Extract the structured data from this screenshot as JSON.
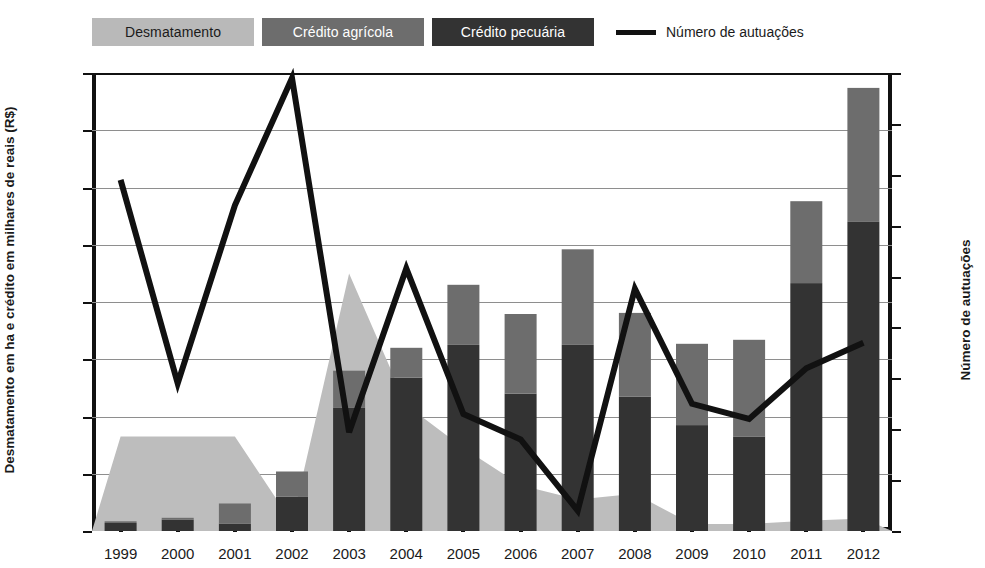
{
  "legend": {
    "items": [
      {
        "label": "Desmatamento",
        "type": "area",
        "color": "#bdbdbd"
      },
      {
        "label": "Crédito agrícola",
        "type": "bar",
        "color": "#6d6d6d"
      },
      {
        "label": "Crédito pecuária",
        "type": "bar",
        "color": "#333333"
      },
      {
        "label": "Número de autuações",
        "type": "line",
        "color": "#111111"
      }
    ]
  },
  "axes": {
    "left": {
      "title": "Desmatamento em ha e crédito em milhares de reais (R$)",
      "ticks": [
        "0",
        "10.000",
        "20.000",
        "30.000",
        "40.000",
        "50.000",
        "60.000",
        "70.000",
        "80.000"
      ],
      "min": 0,
      "max": 80000,
      "step": 10000
    },
    "right": {
      "title": "Número de autuações",
      "ticks": [
        "0",
        "5",
        "10",
        "15",
        "20",
        "25",
        "30",
        "35",
        "40",
        "45"
      ],
      "min": 0,
      "max": 45,
      "step": 5
    },
    "x": {
      "categories": [
        "1999",
        "2000",
        "2001",
        "2002",
        "2003",
        "2004",
        "2005",
        "2006",
        "2007",
        "2008",
        "2009",
        "2010",
        "2011",
        "2012"
      ]
    }
  },
  "chart_data": {
    "type": "bar",
    "title": "",
    "xlabel": "",
    "ylabel": "Desmatamento em ha e crédito em milhares de reais (R$)",
    "ylabel_secondary": "Número de autuações",
    "ylim": [
      0,
      80000
    ],
    "ylim_secondary": [
      0,
      45
    ],
    "grid": true,
    "legend_position": "top-left",
    "categories": [
      "1999",
      "2000",
      "2001",
      "2002",
      "2003",
      "2004",
      "2005",
      "2006",
      "2007",
      "2008",
      "2009",
      "2010",
      "2011",
      "2012"
    ],
    "series": [
      {
        "name": "Desmatamento",
        "type": "area",
        "axis": "left",
        "color": "#bdbdbd",
        "values": [
          16500,
          16500,
          16500,
          1500,
          45000,
          22000,
          14500,
          8000,
          5500,
          6500,
          1200,
          1200,
          1800,
          2200
        ]
      },
      {
        "name": "Crédito pecuária",
        "type": "bar-stack-bottom",
        "axis": "left",
        "color": "#333333",
        "values": [
          1400,
          2000,
          1300,
          6000,
          21500,
          26800,
          32500,
          24000,
          32500,
          23500,
          18500,
          16500,
          43300,
          54000
        ]
      },
      {
        "name": "Crédito agrícola",
        "type": "bar-stack-top",
        "axis": "left",
        "color": "#6d6d6d",
        "values": [
          300,
          300,
          3500,
          4400,
          6500,
          5200,
          10500,
          13900,
          16700,
          14600,
          14200,
          16900,
          14300,
          23400
        ]
      },
      {
        "name": "Número de autuações",
        "type": "line",
        "axis": "right",
        "color": "#111111",
        "values": [
          34.5,
          14.5,
          32.0,
          44.5,
          9.7,
          25.8,
          11.5,
          9.0,
          2.0,
          23.8,
          12.5,
          11.0,
          16.0,
          18.5
        ]
      }
    ],
    "stacked_totals": [
      1700,
      2300,
      4800,
      10400,
      28000,
      32000,
      43000,
      37900,
      49200,
      38100,
      32700,
      33400,
      57600,
      77400
    ]
  }
}
